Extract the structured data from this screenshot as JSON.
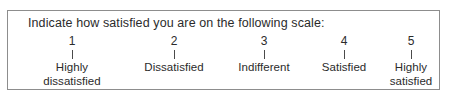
{
  "survey": {
    "question": "Indicate how satisfied you are on the following scale:",
    "border_color": "#8d8d8d",
    "text_color": "#2b2b2b",
    "tick_color": "#4a4a4a",
    "scale": [
      {
        "number": "1",
        "tick": "vertical-tick",
        "label_line1": "Highly",
        "label_line2": "dissatisfied",
        "x": 64
      },
      {
        "number": "2",
        "tick": "vertical-tick",
        "label_line1": "Dissatisfied",
        "label_line2": "",
        "x": 166
      },
      {
        "number": "3",
        "tick": "vertical-tick",
        "label_line1": "Indifferent",
        "label_line2": "",
        "x": 256
      },
      {
        "number": "4",
        "tick": "vertical-tick",
        "label_line1": "Satisfied",
        "label_line2": "",
        "x": 336
      },
      {
        "number": "5",
        "tick": "vertical-tick",
        "label_line1": "Highly",
        "label_line2": "satisfied",
        "x": 403
      }
    ]
  }
}
